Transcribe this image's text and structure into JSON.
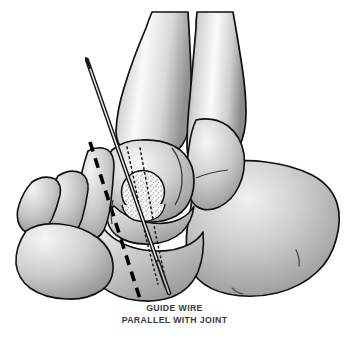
{
  "figure": {
    "background_color": "#ffffff",
    "width": 349,
    "height": 344
  },
  "caption": {
    "line1": "GUIDE WIRE",
    "line2": "PARALLEL WITH JOINT",
    "color": "#3a3a3a"
  },
  "colors": {
    "outline": "#101010",
    "bone_light": "#f2f2f2",
    "bone_mid": "#c9c9c9",
    "bone_dark": "#8f8f8f",
    "bone_shadow": "#6f6f6f",
    "graft_fill": "#f4f4f4",
    "stipple": "#8a8a8a",
    "wire": "#1a1a1a",
    "dashed_line": "#000000",
    "dotted_line": "#1a1a1a"
  },
  "anatomy": {
    "bones": [
      {
        "name": "tibia",
        "label": "Tibia shaft"
      },
      {
        "name": "fibula",
        "label": "Fibula shaft"
      },
      {
        "name": "medial-malleolus",
        "label": "Medial malleolus"
      },
      {
        "name": "talus",
        "label": "Talus"
      },
      {
        "name": "calcaneus",
        "label": "Calcaneus"
      },
      {
        "name": "navicular",
        "label": "Navicular"
      },
      {
        "name": "cuneiform",
        "label": "Cuneiform"
      },
      {
        "name": "metatarsal-base",
        "label": "Metatarsal base"
      },
      {
        "name": "metatarsal-shaft",
        "label": "Metatarsal shaft"
      },
      {
        "name": "cuboid",
        "label": "Cuboid"
      }
    ]
  },
  "markers": {
    "guide_wire": {
      "name": "guide-wire",
      "entry_point": "88,62",
      "exit_point": "168,292",
      "description": "Hollow guide wire entering dorsally and exiting plantar"
    },
    "osteotomy_line": {
      "name": "osteotomy-dashed-line",
      "style": "dashed",
      "start": "90,143",
      "end": "140,298"
    },
    "tunnel_lines": {
      "name": "tunnel-dotted-lines",
      "style": "dotted",
      "count": 2
    },
    "graft_circle": {
      "name": "cancellous-graft-circle",
      "center": "143,192",
      "radius": 21,
      "texture": "stippled"
    }
  }
}
